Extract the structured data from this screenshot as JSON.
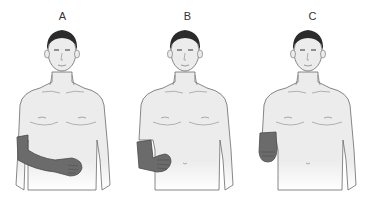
{
  "figures": [
    {
      "label": "A",
      "coverage": "full-arm",
      "description": "Right arm covered from upper arm to hand, hand resting on abdomen"
    },
    {
      "label": "B",
      "coverage": "forearm",
      "description": "Right forearm and hand covered, hand at waist"
    },
    {
      "label": "C",
      "coverage": "hand",
      "description": "Right hand/wrist covered only"
    }
  ],
  "colors": {
    "skin": "#ececec",
    "outline": "#6a6a6a",
    "hair": "#2b2b2b",
    "highlight": "#6b6b6b",
    "highlight_outline": "#4a4a4a"
  }
}
